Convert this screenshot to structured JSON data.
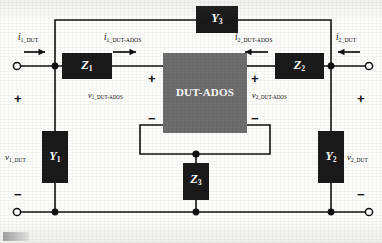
{
  "figure": {
    "type": "two-port-network-schematic",
    "center_block": {
      "label": "DUT-ADOS",
      "fill": "#6e6e6e"
    },
    "element_fill": "#1a1a1a",
    "wire_color": "#111111",
    "background": "#fdfdfc"
  },
  "components": {
    "z1": {
      "name": "Z",
      "sub": "1",
      "orientation": "horizontal"
    },
    "z2": {
      "name": "Z",
      "sub": "2",
      "orientation": "horizontal"
    },
    "z3": {
      "name": "Z",
      "sub": "3",
      "orientation": "vertical"
    },
    "y1": {
      "name": "Y",
      "sub": "1",
      "orientation": "vertical"
    },
    "y2": {
      "name": "Y",
      "sub": "2",
      "orientation": "vertical"
    },
    "y3": {
      "name": "Y",
      "sub": "3",
      "orientation": "horizontal"
    }
  },
  "currents": {
    "i1_dut": {
      "sym": "i",
      "sub": "1_DUT",
      "direction": "right"
    },
    "i1_dut_ados": {
      "sym": "i",
      "sub": "1_DUT-ADOS",
      "direction": "right"
    },
    "i2_dut_ados": {
      "sym": "i",
      "sub": "2_DUT-ADOS",
      "direction": "left"
    },
    "i2_dut": {
      "sym": "i",
      "sub": "2_DUT",
      "direction": "left"
    }
  },
  "voltages": {
    "v1_dut": {
      "sym": "v",
      "sub": "1_DUT"
    },
    "v1_dut_ados": {
      "sym": "v",
      "sub": "1_DUT-ADOS"
    },
    "v2_dut_ados": {
      "sym": "v",
      "sub": "2_DUT-ADOS"
    },
    "v2_dut": {
      "sym": "v",
      "sub": "2_DUT"
    }
  },
  "polarity": {
    "plus": "+",
    "minus": "−",
    "marks": [
      {
        "id": "port1-plus",
        "sign": "+"
      },
      {
        "id": "port1-minus",
        "sign": "−"
      },
      {
        "id": "port2-plus",
        "sign": "+"
      },
      {
        "id": "port2-minus",
        "sign": "−"
      },
      {
        "id": "dut-left-plus",
        "sign": "+"
      },
      {
        "id": "dut-left-minus",
        "sign": "−"
      },
      {
        "id": "dut-right-plus",
        "sign": "+"
      },
      {
        "id": "dut-right-minus",
        "sign": "−"
      }
    ]
  },
  "terminals": [
    {
      "id": "port1-top",
      "style": "open-circle"
    },
    {
      "id": "port1-bottom",
      "style": "open-circle"
    },
    {
      "id": "port2-top",
      "style": "open-circle"
    },
    {
      "id": "port2-bottom",
      "style": "open-circle"
    }
  ],
  "nodes": [
    {
      "id": "node-left-top"
    },
    {
      "id": "node-left-bottom"
    },
    {
      "id": "node-right-top"
    },
    {
      "id": "node-right-bottom"
    },
    {
      "id": "node-center-bottom"
    }
  ]
}
